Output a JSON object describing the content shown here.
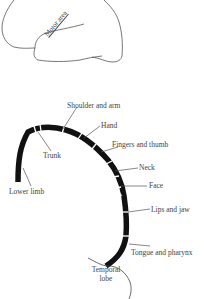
{
  "brain_outline": {
    "label": "Motor area"
  },
  "motor_strip": {
    "labels": [
      {
        "id": "shoulder-and-arm",
        "text": "Shoulder and arm"
      },
      {
        "id": "hand",
        "text": "Hand"
      },
      {
        "id": "fingers-and-thumb",
        "text": "Fingers and thumb"
      },
      {
        "id": "neck",
        "text": "Neck"
      },
      {
        "id": "face",
        "text": "Face"
      },
      {
        "id": "lips-and-jaw",
        "text": "Lips and jaw"
      },
      {
        "id": "tongue-and-pharynx",
        "text": "Tongue and pharynx"
      },
      {
        "id": "trunk",
        "text": "Trunk"
      },
      {
        "id": "lower-limb",
        "text": "Lower limb"
      }
    ],
    "temporal_lobe": {
      "line1": "Temporal",
      "line2": "lobe"
    }
  }
}
